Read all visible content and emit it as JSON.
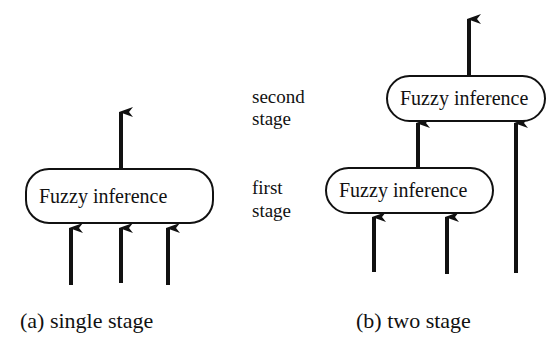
{
  "diagram": {
    "single": {
      "box_label": "Fuzzy inference",
      "caption": "(a) single stage",
      "inputs": 3,
      "outputs": 1
    },
    "two": {
      "stage_labels": {
        "second": [
          "second",
          "stage"
        ],
        "first": [
          "first",
          "stage"
        ]
      },
      "upper_box_label": "Fuzzy inference",
      "lower_box_label": "Fuzzy inference",
      "caption": "(b) two stage",
      "lower_inputs": 2,
      "direct_inputs_to_upper": 1
    }
  }
}
